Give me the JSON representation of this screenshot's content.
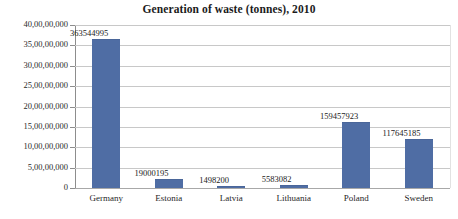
{
  "chart_data": {
    "type": "bar",
    "title": "Generation of waste (tonnes), 2010",
    "xlabel": "",
    "ylabel": "",
    "categories": [
      "Germany",
      "Estonia",
      "Latvia",
      "Lithuania",
      "Poland",
      "Sweden"
    ],
    "values": [
      363544995,
      19000195,
      1498200,
      5583082,
      159457923,
      117645185
    ],
    "value_labels": [
      "363544995",
      "19000195",
      "1498200",
      "5583082",
      "159457923",
      "117645185"
    ],
    "ylim": [
      0,
      400000000
    ],
    "ytick_values": [
      400000000,
      350000000,
      300000000,
      250000000,
      200000000,
      150000000,
      100000000,
      50000000,
      0
    ],
    "ytick_labels": [
      "40,00,00,000",
      "35,00,00,000",
      "30,00,00,000",
      "25,00,00,000",
      "20,00,00,000",
      "15,00,00,000",
      "10,00,00,000",
      "5,00,00,000",
      "0"
    ],
    "grid": true,
    "legend": false,
    "legend_position": "none",
    "series": [
      {
        "name": "Generation of waste (tonnes), 2010",
        "color": "#4f6da4",
        "values": [
          363544995,
          19000195,
          1498200,
          5583082,
          159457923,
          117645185
        ]
      }
    ],
    "colors": {
      "bar": "#4f6da4",
      "gridline": "#c8c8c8",
      "axis": "#8d8d8d",
      "text": "#222222",
      "background": "#ffffff"
    }
  }
}
